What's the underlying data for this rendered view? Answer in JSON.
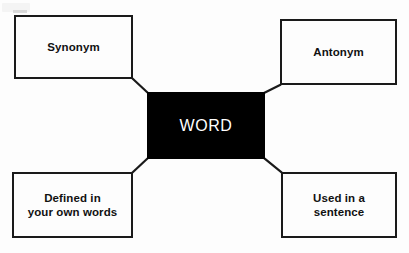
{
  "diagram": {
    "background_color": "#fdfdfd",
    "line_color": "#1a1a1a",
    "center": {
      "label": "WORD",
      "name": "center-node",
      "fill_color": "#000000",
      "text_color": "#ffffff"
    },
    "nodes": [
      {
        "id": "synonym",
        "label": "Synonym",
        "position": "top-left",
        "fill_color": "#fdfdfd",
        "text_color": "#111111"
      },
      {
        "id": "antonym",
        "label": "Antonym",
        "position": "top-right",
        "fill_color": "#fdfdfd",
        "text_color": "#111111"
      },
      {
        "id": "defined",
        "label": "Defined in\nyour own words",
        "position": "bottom-left",
        "fill_color": "#fdfdfd",
        "text_color": "#111111"
      },
      {
        "id": "sentence",
        "label": "Used in a\nsentence",
        "position": "bottom-right",
        "fill_color": "#fdfdfd",
        "text_color": "#111111"
      }
    ],
    "connectors": [
      {
        "from": "synonym",
        "to": "center"
      },
      {
        "from": "antonym",
        "to": "center"
      },
      {
        "from": "defined",
        "to": "center"
      },
      {
        "from": "sentence",
        "to": "center"
      }
    ]
  }
}
